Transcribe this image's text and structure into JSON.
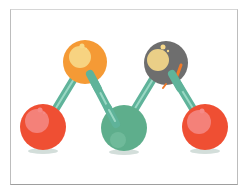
{
  "illustration": {
    "subject": "molecule-model",
    "colors": {
      "frame_border": "#bdbdbd",
      "bond": "#5fb39a",
      "bond_highlight": "#9ad8c4",
      "orange_atom": "#f59a35",
      "gray_atom": "#6e6e6e",
      "red_atom": "#ef4f33",
      "green_atom": "#5eae8c",
      "highlight_yellow": "#f7d98a",
      "highlight_pink": "#f58a86",
      "shadow": "#c9d6d2"
    },
    "atoms": [
      {
        "name": "red-atom-left",
        "cx": 43,
        "cy": 127,
        "r": 23
      },
      {
        "name": "orange-atom",
        "cx": 85,
        "cy": 62,
        "r": 22
      },
      {
        "name": "green-atom",
        "cx": 124,
        "cy": 128,
        "r": 23
      },
      {
        "name": "gray-atom",
        "cx": 166,
        "cy": 63,
        "r": 22
      },
      {
        "name": "red-atom-right",
        "cx": 205,
        "cy": 127,
        "r": 23
      }
    ]
  }
}
